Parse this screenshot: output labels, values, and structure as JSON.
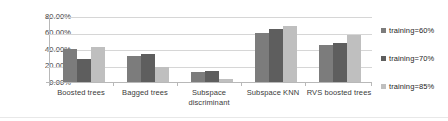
{
  "chart_data": {
    "type": "bar",
    "title": "",
    "xlabel": "",
    "ylabel": "",
    "ylim": [
      0,
      80
    ],
    "grid": true,
    "legend_position": "right",
    "ytick_labels": [
      "80.00%",
      "60.00%",
      "40.00%",
      "20.00%",
      "0.00%"
    ],
    "ytick_values": [
      80,
      60,
      40,
      20,
      0
    ],
    "categories": [
      "Boosted trees",
      "Bagged trees",
      "Subspace discriminant",
      "Subspace KNN",
      "RVS boosted trees"
    ],
    "series": [
      {
        "name": "training=60%",
        "color": "#7c7c7c",
        "values": [
          40,
          32,
          12,
          60,
          45
        ]
      },
      {
        "name": "training=70%",
        "color": "#5e5e5e",
        "values": [
          28,
          34,
          13,
          64,
          47
        ]
      },
      {
        "name": "training=85%",
        "color": "#bfbfbf",
        "values": [
          43,
          18,
          4,
          68,
          57
        ]
      }
    ]
  },
  "axis": {
    "yticks": [
      {
        "label": "80.00%"
      },
      {
        "label": "60.00%"
      },
      {
        "label": "40.00%"
      },
      {
        "label": "20.00%"
      },
      {
        "label": "0.00%"
      }
    ],
    "xticks": [
      {
        "line1": "Boosted trees",
        "line2": ""
      },
      {
        "line1": "Bagged trees",
        "line2": ""
      },
      {
        "line1": "Subspace",
        "line2": "discriminant"
      },
      {
        "line1": "Subspace KNN",
        "line2": ""
      },
      {
        "line1": "RVS boosted trees",
        "line2": ""
      }
    ]
  },
  "legend": {
    "items": [
      {
        "label": "training=60%"
      },
      {
        "label": "training=70%"
      },
      {
        "label": "training=85%"
      }
    ]
  }
}
